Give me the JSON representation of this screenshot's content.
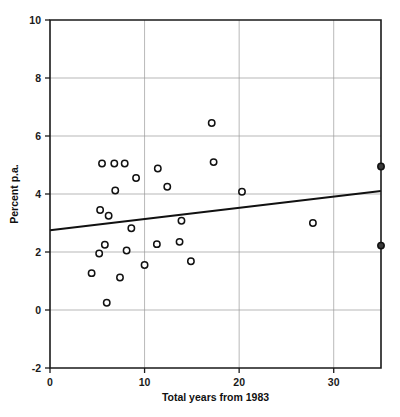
{
  "chart_data": {
    "type": "scatter",
    "title": "",
    "subtitle": "",
    "xlabel": "Total years from 1983",
    "ylabel": "Percent p.a.",
    "xlim": [
      0,
      35
    ],
    "ylim": [
      -2,
      10
    ],
    "xticks": [
      0,
      10,
      20,
      30
    ],
    "xtick_labels": [
      "0",
      "10",
      "20",
      "30"
    ],
    "yticks": [
      -2,
      0,
      2,
      4,
      6,
      8,
      10
    ],
    "ytick_labels": [
      "-2",
      "0",
      "2",
      "4",
      "6",
      "8",
      "10"
    ],
    "grid": true,
    "grid_axis": "y",
    "legend": false,
    "legend_position": "none",
    "marker": "open-circle",
    "series": [
      {
        "name": "observations",
        "marker_style": "open-circle",
        "points": [
          {
            "x": 4.4,
            "y": 1.27
          },
          {
            "x": 5.2,
            "y": 1.95
          },
          {
            "x": 5.3,
            "y": 3.45
          },
          {
            "x": 5.5,
            "y": 5.05
          },
          {
            "x": 5.8,
            "y": 2.25
          },
          {
            "x": 6.0,
            "y": 0.25
          },
          {
            "x": 6.2,
            "y": 3.25
          },
          {
            "x": 6.8,
            "y": 5.05
          },
          {
            "x": 6.9,
            "y": 4.12
          },
          {
            "x": 7.4,
            "y": 1.12
          },
          {
            "x": 7.9,
            "y": 5.05
          },
          {
            "x": 8.1,
            "y": 2.05
          },
          {
            "x": 8.6,
            "y": 2.82
          },
          {
            "x": 9.1,
            "y": 4.55
          },
          {
            "x": 10.0,
            "y": 1.55
          },
          {
            "x": 11.3,
            "y": 2.27
          },
          {
            "x": 11.4,
            "y": 4.88
          },
          {
            "x": 12.4,
            "y": 4.25
          },
          {
            "x": 13.7,
            "y": 2.35
          },
          {
            "x": 13.9,
            "y": 3.08
          },
          {
            "x": 14.9,
            "y": 1.68
          },
          {
            "x": 17.1,
            "y": 6.45
          },
          {
            "x": 17.3,
            "y": 5.1
          },
          {
            "x": 20.3,
            "y": 4.08
          },
          {
            "x": 27.8,
            "y": 3.0
          }
        ]
      },
      {
        "name": "boundary-observations",
        "marker_style": "filled-circle",
        "points": [
          {
            "x": 35.0,
            "y": 4.95
          },
          {
            "x": 35.0,
            "y": 2.22
          }
        ]
      }
    ],
    "trendline": {
      "name": "linear fit",
      "x_start": 0,
      "y_start": 2.75,
      "x_end": 35,
      "y_end": 4.1
    }
  }
}
